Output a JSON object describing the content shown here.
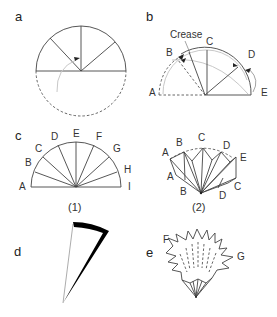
{
  "figure": {
    "panels": {
      "a": {
        "label": "a"
      },
      "b": {
        "label": "b",
        "crease_label": "Crease",
        "points": [
          "A",
          "B",
          "C",
          "D",
          "E"
        ]
      },
      "c": {
        "label": "c",
        "points": [
          "A",
          "B",
          "C",
          "D",
          "E",
          "F",
          "G",
          "H",
          "I"
        ],
        "caption_1": "(1)"
      },
      "c2": {
        "top_points": [
          "A",
          "B",
          "C",
          "D",
          "E"
        ],
        "bottom_points": [
          "A",
          "B",
          "D",
          "C"
        ],
        "caption_2": "(2)"
      },
      "d": {
        "label": "d"
      },
      "e": {
        "label": "e",
        "points": [
          "F",
          "G"
        ]
      }
    },
    "colors": {
      "line": "#444444",
      "faint": "#c8c8c8",
      "fill_dark": "#000000",
      "background": "#ffffff"
    }
  }
}
